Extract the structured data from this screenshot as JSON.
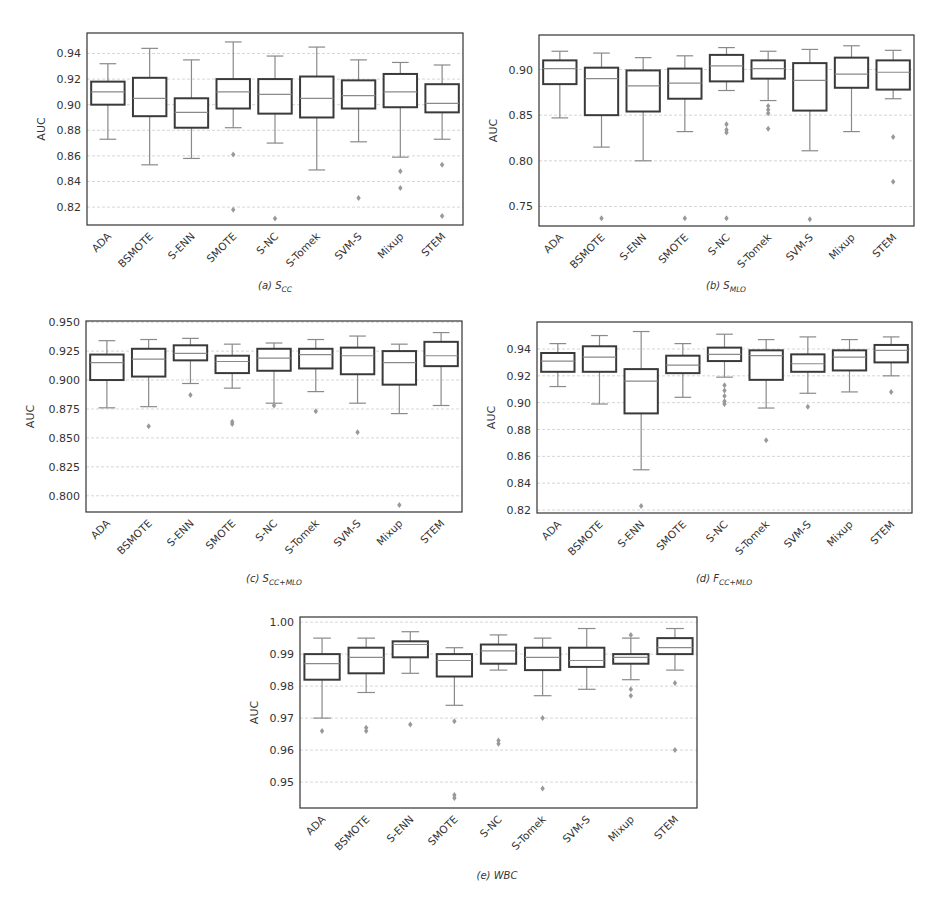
{
  "figure": {
    "ylabel": "AUC",
    "categories": [
      "ADA",
      "BSMOTE",
      "S-ENN",
      "SMOTE",
      "S-NC",
      "S-Tomek",
      "SVM-S",
      "Mixup",
      "STEM"
    ],
    "colors": {
      "box": "#3a3a3a",
      "whisker": "#8a8a8a",
      "median": "#8a8a8a",
      "outlier": "#999999",
      "grid": "#cccccc",
      "frame": "#333333"
    }
  },
  "chart_data": [
    {
      "type": "box",
      "id": "a",
      "title": "(a) S_CC",
      "caption_prefix": "(a) ",
      "caption_main": "S",
      "caption_sub": "CC",
      "xlabel": "",
      "ylabel": "AUC",
      "ylim": [
        0.806,
        0.956
      ],
      "yticks": [
        0.82,
        0.84,
        0.86,
        0.88,
        0.9,
        0.92,
        0.94
      ],
      "ytick_labels": [
        "0.82",
        "0.84",
        "0.86",
        "0.88",
        "0.90",
        "0.92",
        "0.94"
      ],
      "grid": true,
      "categories": [
        "ADA",
        "BSMOTE",
        "S-ENN",
        "SMOTE",
        "S-NC",
        "S-Tomek",
        "SVM-S",
        "Mixup",
        "STEM"
      ],
      "boxes": [
        {
          "whislo": 0.873,
          "q1": 0.9,
          "med": 0.91,
          "q3": 0.918,
          "whishi": 0.932,
          "fliers": []
        },
        {
          "whislo": 0.853,
          "q1": 0.891,
          "med": 0.905,
          "q3": 0.921,
          "whishi": 0.944,
          "fliers": []
        },
        {
          "whislo": 0.858,
          "q1": 0.882,
          "med": 0.894,
          "q3": 0.905,
          "whishi": 0.935,
          "fliers": []
        },
        {
          "whislo": 0.882,
          "q1": 0.897,
          "med": 0.91,
          "q3": 0.92,
          "whishi": 0.949,
          "fliers": [
            0.861,
            0.818
          ]
        },
        {
          "whislo": 0.87,
          "q1": 0.893,
          "med": 0.908,
          "q3": 0.92,
          "whishi": 0.938,
          "fliers": [
            0.811
          ]
        },
        {
          "whislo": 0.849,
          "q1": 0.89,
          "med": 0.905,
          "q3": 0.922,
          "whishi": 0.945,
          "fliers": []
        },
        {
          "whislo": 0.871,
          "q1": 0.897,
          "med": 0.907,
          "q3": 0.919,
          "whishi": 0.935,
          "fliers": [
            0.827
          ]
        },
        {
          "whislo": 0.859,
          "q1": 0.898,
          "med": 0.91,
          "q3": 0.924,
          "whishi": 0.933,
          "fliers": [
            0.848,
            0.835
          ]
        },
        {
          "whislo": 0.873,
          "q1": 0.894,
          "med": 0.901,
          "q3": 0.916,
          "whishi": 0.931,
          "fliers": [
            0.853,
            0.813
          ]
        }
      ],
      "layout": {
        "left": 87,
        "top": 33,
        "width": 376,
        "height": 192,
        "caption_x": 275,
        "caption_y": 280
      }
    },
    {
      "type": "box",
      "id": "b",
      "title": "(b) S_MLO",
      "caption_prefix": "(b) ",
      "caption_main": "S",
      "caption_sub": "MLO",
      "xlabel": "",
      "ylabel": "AUC",
      "ylim": [
        0.7286,
        0.9378
      ],
      "yticks": [
        0.75,
        0.8,
        0.85,
        0.9
      ],
      "ytick_labels": [
        "0.75",
        "0.80",
        "0.85",
        "0.90"
      ],
      "grid": true,
      "categories": [
        "ADA",
        "BSMOTE",
        "S-ENN",
        "SMOTE",
        "S-NC",
        "S-Tomek",
        "SVM-S",
        "Mixup",
        "STEM"
      ],
      "boxes": [
        {
          "whislo": 0.847,
          "q1": 0.884,
          "med": 0.901,
          "q3": 0.91,
          "whishi": 0.92,
          "fliers": []
        },
        {
          "whislo": 0.815,
          "q1": 0.85,
          "med": 0.89,
          "q3": 0.902,
          "whishi": 0.918,
          "fliers": [
            0.737
          ]
        },
        {
          "whislo": 0.8,
          "q1": 0.854,
          "med": 0.882,
          "q3": 0.899,
          "whishi": 0.913,
          "fliers": []
        },
        {
          "whislo": 0.832,
          "q1": 0.868,
          "med": 0.885,
          "q3": 0.901,
          "whishi": 0.915,
          "fliers": [
            0.737
          ]
        },
        {
          "whislo": 0.877,
          "q1": 0.887,
          "med": 0.904,
          "q3": 0.916,
          "whishi": 0.924,
          "fliers": [
            0.84,
            0.834,
            0.831,
            0.737
          ]
        },
        {
          "whislo": 0.866,
          "q1": 0.89,
          "med": 0.901,
          "q3": 0.91,
          "whishi": 0.92,
          "fliers": [
            0.86,
            0.856,
            0.852,
            0.835
          ]
        },
        {
          "whislo": 0.811,
          "q1": 0.855,
          "med": 0.888,
          "q3": 0.907,
          "whishi": 0.922,
          "fliers": [
            0.736
          ]
        },
        {
          "whislo": 0.832,
          "q1": 0.88,
          "med": 0.895,
          "q3": 0.913,
          "whishi": 0.926,
          "fliers": []
        },
        {
          "whislo": 0.868,
          "q1": 0.878,
          "med": 0.897,
          "q3": 0.91,
          "whishi": 0.921,
          "fliers": [
            0.826,
            0.777
          ]
        }
      ],
      "layout": {
        "left": 539,
        "top": 35,
        "width": 375,
        "height": 191,
        "caption_x": 726,
        "caption_y": 280
      }
    },
    {
      "type": "box",
      "id": "c",
      "title": "(c) S_CC+MLO",
      "caption_prefix": "(c) ",
      "caption_main": "S",
      "caption_sub": "CC+MLO",
      "xlabel": "",
      "ylabel": "AUC",
      "ylim": [
        0.786,
        0.951
      ],
      "yticks": [
        0.8,
        0.825,
        0.85,
        0.875,
        0.9,
        0.925,
        0.95
      ],
      "ytick_labels": [
        "0.800",
        "0.825",
        "0.850",
        "0.875",
        "0.900",
        "0.925",
        "0.950"
      ],
      "grid": true,
      "categories": [
        "ADA",
        "BSMOTE",
        "S-ENN",
        "SMOTE",
        "S-NC",
        "S-Tomek",
        "SVM-S",
        "Mixup",
        "STEM"
      ],
      "boxes": [
        {
          "whislo": 0.876,
          "q1": 0.9,
          "med": 0.915,
          "q3": 0.922,
          "whishi": 0.934,
          "fliers": []
        },
        {
          "whislo": 0.877,
          "q1": 0.903,
          "med": 0.918,
          "q3": 0.927,
          "whishi": 0.935,
          "fliers": [
            0.86
          ]
        },
        {
          "whislo": 0.897,
          "q1": 0.917,
          "med": 0.923,
          "q3": 0.93,
          "whishi": 0.936,
          "fliers": [
            0.887
          ]
        },
        {
          "whislo": 0.893,
          "q1": 0.906,
          "med": 0.916,
          "q3": 0.921,
          "whishi": 0.931,
          "fliers": [
            0.864,
            0.862
          ]
        },
        {
          "whislo": 0.88,
          "q1": 0.908,
          "med": 0.919,
          "q3": 0.927,
          "whishi": 0.932,
          "fliers": [
            0.878
          ]
        },
        {
          "whislo": 0.89,
          "q1": 0.91,
          "med": 0.922,
          "q3": 0.927,
          "whishi": 0.935,
          "fliers": [
            0.873
          ]
        },
        {
          "whislo": 0.88,
          "q1": 0.905,
          "med": 0.921,
          "q3": 0.928,
          "whishi": 0.938,
          "fliers": [
            0.855
          ]
        },
        {
          "whislo": 0.871,
          "q1": 0.896,
          "med": 0.915,
          "q3": 0.925,
          "whishi": 0.931,
          "fliers": [
            0.792
          ]
        },
        {
          "whislo": 0.878,
          "q1": 0.912,
          "med": 0.921,
          "q3": 0.933,
          "whishi": 0.941,
          "fliers": []
        }
      ],
      "layout": {
        "left": 86,
        "top": 321,
        "width": 376,
        "height": 191,
        "caption_x": 274,
        "caption_y": 573
      }
    },
    {
      "type": "box",
      "id": "d",
      "title": "(d) F_CC+MLO",
      "caption_prefix": "(d) ",
      "caption_main": "F",
      "caption_sub": "CC+MLO",
      "xlabel": "",
      "ylabel": "AUC",
      "ylim": [
        0.8178,
        0.9601
      ],
      "yticks": [
        0.82,
        0.84,
        0.86,
        0.88,
        0.9,
        0.92,
        0.94
      ],
      "ytick_labels": [
        "0.82",
        "0.84",
        "0.86",
        "0.88",
        "0.90",
        "0.92",
        "0.94"
      ],
      "grid": true,
      "categories": [
        "ADA",
        "BSMOTE",
        "S-ENN",
        "SMOTE",
        "S-NC",
        "S-Tomek",
        "SVM-S",
        "Mixup",
        "STEM"
      ],
      "boxes": [
        {
          "whislo": 0.912,
          "q1": 0.923,
          "med": 0.931,
          "q3": 0.937,
          "whishi": 0.944,
          "fliers": []
        },
        {
          "whislo": 0.899,
          "q1": 0.923,
          "med": 0.934,
          "q3": 0.942,
          "whishi": 0.95,
          "fliers": []
        },
        {
          "whislo": 0.85,
          "q1": 0.892,
          "med": 0.916,
          "q3": 0.925,
          "whishi": 0.953,
          "fliers": [
            0.823
          ]
        },
        {
          "whislo": 0.904,
          "q1": 0.922,
          "med": 0.928,
          "q3": 0.935,
          "whishi": 0.944,
          "fliers": []
        },
        {
          "whislo": 0.919,
          "q1": 0.931,
          "med": 0.936,
          "q3": 0.941,
          "whishi": 0.951,
          "fliers": [
            0.913,
            0.909,
            0.905,
            0.901,
            0.899
          ]
        },
        {
          "whislo": 0.896,
          "q1": 0.917,
          "med": 0.935,
          "q3": 0.939,
          "whishi": 0.947,
          "fliers": [
            0.872
          ]
        },
        {
          "whislo": 0.907,
          "q1": 0.923,
          "med": 0.929,
          "q3": 0.936,
          "whishi": 0.949,
          "fliers": [
            0.897
          ]
        },
        {
          "whislo": 0.908,
          "q1": 0.924,
          "med": 0.934,
          "q3": 0.939,
          "whishi": 0.947,
          "fliers": []
        },
        {
          "whislo": 0.92,
          "q1": 0.93,
          "med": 0.939,
          "q3": 0.943,
          "whishi": 0.949,
          "fliers": [
            0.908
          ]
        }
      ],
      "layout": {
        "left": 537,
        "top": 322,
        "width": 375,
        "height": 191,
        "caption_x": 724,
        "caption_y": 573
      }
    },
    {
      "type": "box",
      "id": "e",
      "title": "(e) WBC",
      "caption_prefix": "(e) ",
      "caption_main": "WBC",
      "caption_sub": "",
      "xlabel": "",
      "ylabel": "AUC",
      "ylim": [
        0.9419,
        1.0016
      ],
      "yticks": [
        0.95,
        0.96,
        0.97,
        0.98,
        0.99,
        1.0
      ],
      "ytick_labels": [
        "0.95",
        "0.96",
        "0.97",
        "0.98",
        "0.99",
        "1.00"
      ],
      "grid": true,
      "categories": [
        "ADA",
        "BSMOTE",
        "S-ENN",
        "SMOTE",
        "S-NC",
        "S-Tomek",
        "SVM-S",
        "Mixup",
        "STEM"
      ],
      "boxes": [
        {
          "whislo": 0.97,
          "q1": 0.982,
          "med": 0.987,
          "q3": 0.99,
          "whishi": 0.995,
          "fliers": [
            0.966
          ]
        },
        {
          "whislo": 0.978,
          "q1": 0.984,
          "med": 0.989,
          "q3": 0.992,
          "whishi": 0.995,
          "fliers": [
            0.967,
            0.966
          ]
        },
        {
          "whislo": 0.984,
          "q1": 0.989,
          "med": 0.993,
          "q3": 0.994,
          "whishi": 0.997,
          "fliers": [
            0.968
          ]
        },
        {
          "whislo": 0.974,
          "q1": 0.983,
          "med": 0.988,
          "q3": 0.99,
          "whishi": 0.992,
          "fliers": [
            0.969,
            0.946,
            0.945
          ]
        },
        {
          "whislo": 0.985,
          "q1": 0.987,
          "med": 0.991,
          "q3": 0.993,
          "whishi": 0.996,
          "fliers": [
            0.963,
            0.962
          ]
        },
        {
          "whislo": 0.977,
          "q1": 0.985,
          "med": 0.989,
          "q3": 0.992,
          "whishi": 0.995,
          "fliers": [
            0.97,
            0.948
          ]
        },
        {
          "whislo": 0.979,
          "q1": 0.986,
          "med": 0.988,
          "q3": 0.992,
          "whishi": 0.998,
          "fliers": []
        },
        {
          "whislo": 0.982,
          "q1": 0.987,
          "med": 0.989,
          "q3": 0.99,
          "whishi": 0.995,
          "fliers": [
            0.996,
            0.979,
            0.977
          ]
        },
        {
          "whislo": 0.985,
          "q1": 0.99,
          "med": 0.992,
          "q3": 0.995,
          "whishi": 0.998,
          "fliers": [
            0.981,
            0.96
          ]
        }
      ],
      "layout": {
        "left": 300,
        "top": 617,
        "width": 397,
        "height": 191,
        "caption_x": 497,
        "caption_y": 870
      }
    }
  ]
}
